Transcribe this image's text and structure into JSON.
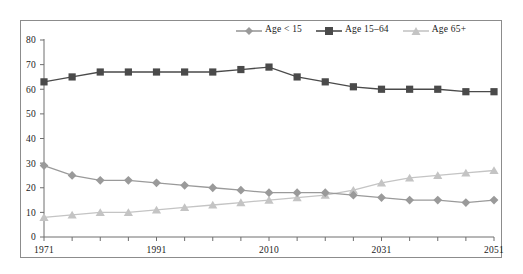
{
  "chart_data": {
    "type": "line",
    "title": "",
    "subtitle": "",
    "xlabel": "",
    "ylabel": "",
    "x": [
      1971,
      1976,
      1981,
      1986,
      1991,
      1996,
      2001,
      2006,
      2010,
      2016,
      2021,
      2026,
      2031,
      2036,
      2041,
      2046,
      2051
    ],
    "xtick_labels": [
      "1971",
      "",
      "",
      "",
      "1991",
      "",
      "",
      "",
      "2010",
      "",
      "",
      "",
      "2031",
      "",
      "",
      "",
      "2051"
    ],
    "xtick_labels_visible": [
      "1971",
      "1991",
      "2010",
      "2031",
      "2051"
    ],
    "ytick_labels": [
      "0",
      "10",
      "20",
      "30",
      "40",
      "50",
      "60",
      "70",
      "80"
    ],
    "yticks": [
      0,
      10,
      20,
      30,
      40,
      50,
      60,
      70,
      80
    ],
    "ylim": [
      0,
      80
    ],
    "grid": false,
    "legend_position": "top-right",
    "series": [
      {
        "name": "Age < 15",
        "color": "#9a9a9a",
        "marker": "diamond",
        "values": [
          29,
          25,
          23,
          23,
          22,
          21,
          20,
          19,
          18,
          18,
          18,
          17,
          16,
          15,
          15,
          14,
          15
        ]
      },
      {
        "name": "Age 15–64",
        "color": "#4a4a4a",
        "marker": "square",
        "values": [
          63,
          65,
          67,
          67,
          67,
          67,
          67,
          68,
          69,
          65,
          63,
          61,
          60,
          60,
          60,
          59,
          59
        ]
      },
      {
        "name": "Age 65+",
        "color": "#c4c4c4",
        "marker": "triangle",
        "values": [
          8,
          9,
          10,
          10,
          11,
          12,
          13,
          14,
          15,
          16,
          17,
          19,
          22,
          24,
          25,
          26,
          27
        ]
      }
    ]
  },
  "legend": {
    "items": [
      {
        "label": "Age < 15",
        "color": "#9a9a9a",
        "marker": "diamond"
      },
      {
        "label": "Age 15–64",
        "color": "#4a4a4a",
        "marker": "square"
      },
      {
        "label": "Age 65+",
        "color": "#c4c4c4",
        "marker": "triangle"
      }
    ]
  },
  "colors": {
    "age_under_15": "#9a9a9a",
    "age_15_64": "#4a4a4a",
    "age_65_plus": "#c4c4c4",
    "axis": "#6e6e6e",
    "frame": "#8c8c8c",
    "text": "#1a1a1a",
    "background": "#ffffff"
  }
}
